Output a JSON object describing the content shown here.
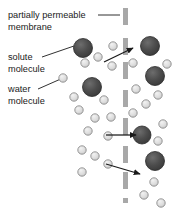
{
  "diagram": {
    "background_color": "#ffffff",
    "width": 181,
    "height": 213
  },
  "labels": [
    {
      "id": "membrane",
      "name": "partially-permeable-membrane-label",
      "line1": "partially permeable",
      "line2": "membrane",
      "x": 8,
      "y1": 18,
      "y2": 30,
      "leader": {
        "x1": 98,
        "y1": 15,
        "x2": 120,
        "y2": 15
      }
    },
    {
      "id": "solute",
      "name": "solute-molecule-label",
      "line1": "solute",
      "line2": "molecule",
      "x": 8,
      "y1": 60,
      "y2": 72,
      "leader": {
        "x1": 42,
        "y1": 57,
        "x2": 74,
        "y2": 46
      }
    },
    {
      "id": "water",
      "name": "water-molecule-label",
      "line1": "water",
      "line2": "molecule",
      "x": 8,
      "y1": 92,
      "y2": 104,
      "leader": {
        "x1": 38,
        "y1": 89,
        "x2": 63,
        "y2": 78
      }
    }
  ],
  "membrane": {
    "name": "partially-permeable-membrane",
    "color": "#a8a8a8",
    "x": 123,
    "dash_width": 5,
    "dashes": [
      {
        "y": 8,
        "h": 17
      },
      {
        "y": 38,
        "h": 17
      },
      {
        "y": 62,
        "h": 17
      },
      {
        "y": 90,
        "h": 17
      },
      {
        "y": 118,
        "h": 17
      },
      {
        "y": 146,
        "h": 17
      },
      {
        "y": 172,
        "h": 17
      },
      {
        "y": 198,
        "h": 5
      }
    ]
  },
  "solute_molecules": {
    "name": "solute-molecule",
    "fill": "#4a4a4a",
    "stroke": "#2b2b2b",
    "items": [
      {
        "cx": 83,
        "cy": 48,
        "r": 9.5,
        "side": "left"
      },
      {
        "cx": 92,
        "cy": 87,
        "r": 9.5,
        "side": "left"
      },
      {
        "cx": 150,
        "cy": 46,
        "r": 9.5,
        "side": "right"
      },
      {
        "cx": 155,
        "cy": 76,
        "r": 9.5,
        "side": "right"
      },
      {
        "cx": 142,
        "cy": 135,
        "r": 9.0,
        "side": "right"
      },
      {
        "cx": 155,
        "cy": 161,
        "r": 9.5,
        "side": "right"
      }
    ]
  },
  "water_molecules": {
    "name": "water-molecule",
    "fill": "#dcdcdc",
    "stroke": "#8c8c8c",
    "items": [
      {
        "cx": 98,
        "cy": 57,
        "r": 4.2
      },
      {
        "cx": 85,
        "cy": 63,
        "r": 4.2
      },
      {
        "cx": 113,
        "cy": 46,
        "r": 4.2
      },
      {
        "cx": 112,
        "cy": 66,
        "r": 4.2
      },
      {
        "cx": 63,
        "cy": 78,
        "r": 4.2
      },
      {
        "cx": 74,
        "cy": 97,
        "r": 4.2
      },
      {
        "cx": 79,
        "cy": 110,
        "r": 4.2
      },
      {
        "cx": 104,
        "cy": 100,
        "r": 4.2
      },
      {
        "cx": 95,
        "cy": 118,
        "r": 4.2
      },
      {
        "cx": 111,
        "cy": 117,
        "r": 4.2
      },
      {
        "cx": 88,
        "cy": 131,
        "r": 4.2
      },
      {
        "cx": 108,
        "cy": 136,
        "r": 4.2
      },
      {
        "cx": 82,
        "cy": 150,
        "r": 4.2
      },
      {
        "cx": 95,
        "cy": 156,
        "r": 4.2
      },
      {
        "cx": 108,
        "cy": 164,
        "r": 4.2
      },
      {
        "cx": 82,
        "cy": 172,
        "r": 4.2
      },
      {
        "cx": 133,
        "cy": 63,
        "r": 4.2
      },
      {
        "cx": 167,
        "cy": 64,
        "r": 4.2
      },
      {
        "cx": 136,
        "cy": 89,
        "r": 4.2
      },
      {
        "cx": 158,
        "cy": 95,
        "r": 4.2
      },
      {
        "cx": 146,
        "cy": 104,
        "r": 4.2
      },
      {
        "cx": 133,
        "cy": 113,
        "r": 4.2
      },
      {
        "cx": 163,
        "cy": 124,
        "r": 4.2
      },
      {
        "cx": 158,
        "cy": 141,
        "r": 4.2
      },
      {
        "cx": 154,
        "cy": 182,
        "r": 4.2
      },
      {
        "cx": 144,
        "cy": 195,
        "r": 4.2
      },
      {
        "cx": 161,
        "cy": 203,
        "r": 4.2
      }
    ]
  },
  "flow_arrows": {
    "name": "water-flow-arrow",
    "color": "#1a1a1a",
    "items": [
      {
        "x1": 104,
        "y1": 62,
        "x2": 133,
        "y2": 48,
        "direction": "up-right"
      },
      {
        "x1": 106,
        "y1": 135,
        "x2": 136,
        "y2": 135,
        "direction": "right"
      },
      {
        "x1": 106,
        "y1": 164,
        "x2": 140,
        "y2": 174,
        "direction": "down-right"
      }
    ]
  }
}
